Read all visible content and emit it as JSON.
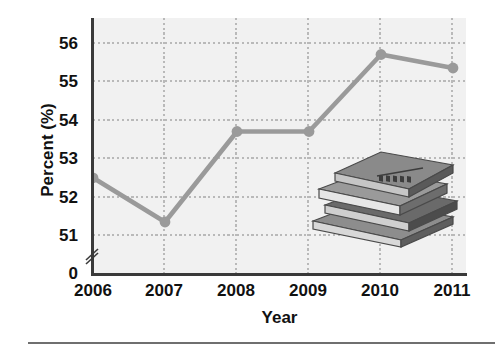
{
  "chart_data": {
    "type": "line",
    "title": "",
    "xlabel": "Year",
    "ylabel": "Percent (%)",
    "categories": [
      "2006",
      "2007",
      "2008",
      "2009",
      "2010",
      "2011"
    ],
    "values": [
      52.5,
      51.35,
      53.7,
      53.7,
      55.7,
      55.35
    ],
    "series": [
      {
        "name": "Percent",
        "values": [
          52.5,
          51.35,
          53.7,
          53.7,
          55.7,
          55.35
        ]
      }
    ],
    "ylim": [
      51,
      56
    ],
    "yticks": [
      "0",
      "51",
      "52",
      "53",
      "54",
      "55",
      "56"
    ],
    "ytick_values": [
      0,
      51,
      52,
      53,
      54,
      55,
      56
    ],
    "xticks": [
      "2006",
      "2007",
      "2008",
      "2009",
      "2010",
      "2011"
    ],
    "grid": true,
    "grid_style": "dotted",
    "legend": "none",
    "axis_break": true,
    "axis_break_note": "y-axis broken between 0 and 51",
    "line_color": "#9a9a9a",
    "marker_color": "#9a9a9a",
    "marker_shape": "circle",
    "plot_background": "#f1f1f1",
    "grid_color": "#b9b9b9",
    "axis_color": "#3a3a3a",
    "text_color": "#111111"
  },
  "decoration": {
    "illustration_name": "stack-of-books",
    "book_count": 4,
    "top_book_cover_text": "WORLD"
  },
  "footer": {
    "rule_color": "#6f6f6f"
  }
}
